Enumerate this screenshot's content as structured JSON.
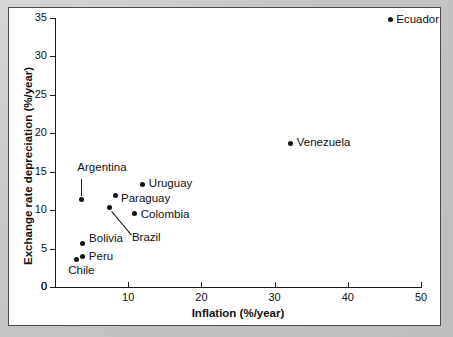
{
  "chart_data": {
    "type": "scatter",
    "title": "",
    "xlabel": "Inflation (%/year)",
    "ylabel": "Exchange rate depreciation (%/year)",
    "xlim": [
      0,
      50
    ],
    "ylim": [
      0,
      35
    ],
    "xticks": [
      0,
      10,
      20,
      30,
      40,
      50
    ],
    "yticks": [
      0,
      5,
      10,
      15,
      20,
      25,
      30,
      35
    ],
    "xticklabels": [
      "0",
      "10",
      "20",
      "30",
      "40",
      "50"
    ],
    "yticklabels": [
      "0",
      "5",
      "10",
      "15",
      "20",
      "25",
      "30",
      "35"
    ],
    "grid": false,
    "legend": "none",
    "points": [
      {
        "label": "Ecuador",
        "x": 45.8,
        "y": 34.8,
        "label_pos": "right"
      },
      {
        "label": "Venezuela",
        "x": 32.2,
        "y": 18.7,
        "label_pos": "right"
      },
      {
        "label": "Uruguay",
        "x": 12.0,
        "y": 13.4,
        "label_pos": "right"
      },
      {
        "label": "Paraguay",
        "x": 8.2,
        "y": 11.9,
        "label_pos": "right"
      },
      {
        "label": "Argentina",
        "x": 3.6,
        "y": 11.4,
        "label_pos": "above-leader"
      },
      {
        "label": "Brazil",
        "x": 7.5,
        "y": 10.3,
        "label_pos": "below-leader"
      },
      {
        "label": "Colombia",
        "x": 10.9,
        "y": 9.5,
        "label_pos": "right"
      },
      {
        "label": "Bolivia",
        "x": 3.7,
        "y": 5.6,
        "label_pos": "right"
      },
      {
        "label": "Peru",
        "x": 3.8,
        "y": 4.0,
        "label_pos": "right"
      },
      {
        "label": "Chile",
        "x": 2.9,
        "y": 3.6,
        "label_pos": "below"
      }
    ]
  },
  "axis_titles": {
    "x": "Inflation (%/year)",
    "y": "Exchange rate depreciation (%/year)"
  },
  "ticklabels": {
    "x": [
      "0",
      "10",
      "20",
      "30",
      "40",
      "50"
    ],
    "y": [
      "0",
      "5",
      "10",
      "15",
      "20",
      "25",
      "30",
      "35"
    ]
  },
  "point_labels": {
    "ecuador": "Ecuador",
    "venezuela": "Venezuela",
    "uruguay": "Uruguay",
    "paraguay": "Paraguay",
    "argentina": "Argentina",
    "brazil": "Brazil",
    "colombia": "Colombia",
    "bolivia": "Bolivia",
    "peru": "Peru",
    "chile": "Chile"
  },
  "colors": {
    "marker": "#111111",
    "axis": "#1a1a1a",
    "panel_bg": "#ffffff",
    "page_bg": "#c9c9c9"
  }
}
